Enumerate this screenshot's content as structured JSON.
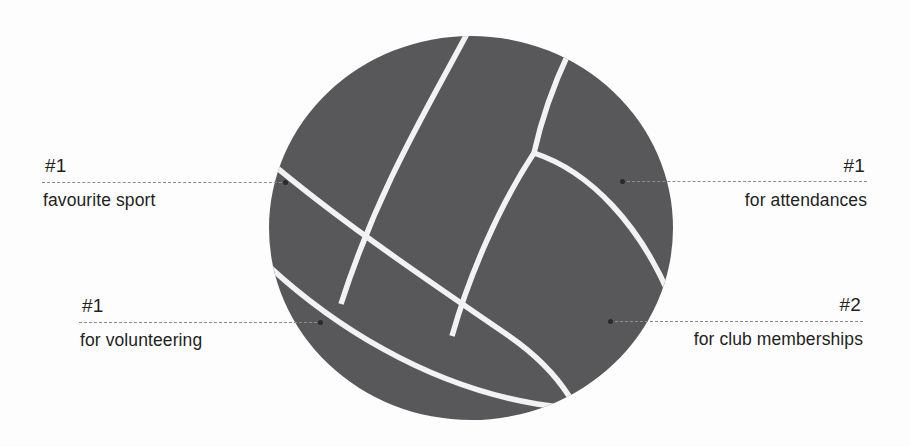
{
  "meta": {
    "background_color": "#fdfdfd",
    "ball_color": "#58585a",
    "seam_color": "#f2f2f2",
    "text_color": "#231f20",
    "leader_color": "#8d8d8d"
  },
  "graphic": {
    "name": "volleyball",
    "icon": "volleyball-icon"
  },
  "callouts": [
    {
      "id": "favourite-sport",
      "rank": "#1",
      "description": "favourite sport",
      "side": "left",
      "row": "top"
    },
    {
      "id": "attendances",
      "rank": "#1",
      "description": "for attendances",
      "side": "right",
      "row": "top"
    },
    {
      "id": "volunteering",
      "rank": "#1",
      "description": "for volunteering",
      "side": "left",
      "row": "bottom"
    },
    {
      "id": "memberships",
      "rank": "#2",
      "description": "for club memberships",
      "side": "right",
      "row": "bottom"
    }
  ]
}
